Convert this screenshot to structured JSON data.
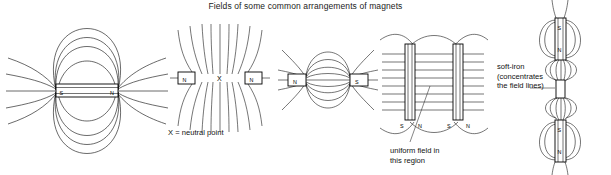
{
  "title": "Fields of some common arrangements of magnets",
  "figures": [
    {
      "id": "single-bar-magnet",
      "name": "single-bar-magnet-field",
      "poles": {
        "left": "S",
        "right": "N"
      },
      "description": "Field of a single bar magnet"
    },
    {
      "id": "like-poles-facing",
      "name": "like-poles-neutral-point-field",
      "poles": {
        "left": "N",
        "right": "N"
      },
      "neutral_point_marker": "X",
      "caption": "X = neutral point"
    },
    {
      "id": "unlike-poles-facing",
      "name": "unlike-poles-attracting-field",
      "poles": {
        "left": "N",
        "right": "S"
      }
    },
    {
      "id": "uniform-field",
      "name": "uniform-field-between-magnets",
      "poles": {
        "left_magnet": [
          "S",
          "N"
        ],
        "right_magnet": [
          "S",
          "N"
        ]
      },
      "caption": "uniform field in\nthis region"
    },
    {
      "id": "soft-iron",
      "name": "soft-iron-concentrating-field",
      "poles": {
        "top_magnet": [
          "S",
          "N"
        ],
        "bottom_magnet": [
          "S",
          "N"
        ]
      },
      "caption": "soft-iron\n(concentrates\nthe field lines)"
    }
  ],
  "colors": {
    "background": "#ffffff",
    "ink": "#1a1a1a",
    "text": "#111111"
  }
}
